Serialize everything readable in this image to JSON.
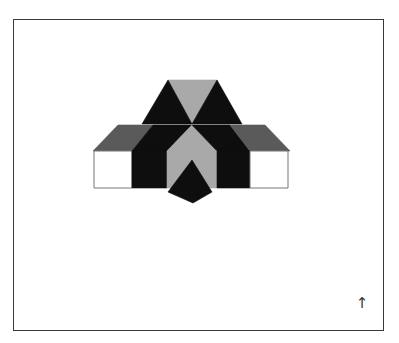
{
  "figure": {
    "frame": {
      "x": 13,
      "y": 19,
      "width": 371,
      "height": 312,
      "stroke": "#3a3a3a"
    },
    "colors": {
      "black": "#0e0e0e",
      "light_gray": "#a9a9a9",
      "mid_gray": "#5a5a5a",
      "white": "#ffffff",
      "outline": "#777777"
    },
    "shapes": [
      {
        "name": "top-gray-triangle",
        "fill": "light_gray",
        "points": "168,80 217,80 192,124"
      },
      {
        "name": "left-black-triangle",
        "fill": "black",
        "points": "168,80 142,124 192,124"
      },
      {
        "name": "right-black-triangle",
        "fill": "black",
        "points": "217,80 192,124 242,124"
      },
      {
        "name": "left-roof",
        "fill": "mid_gray",
        "points": "118,125 153,125 132,151 93,151"
      },
      {
        "name": "left-black-roof",
        "fill": "black",
        "points": "153,125 192,125 167,151 132,151"
      },
      {
        "name": "middle-gray-triangle",
        "fill": "light_gray",
        "points": "192,125 217,151 167,151"
      },
      {
        "name": "right-black-roof",
        "fill": "black",
        "points": "192,125 230,125 250,151 217,151"
      },
      {
        "name": "right-roof",
        "fill": "mid_gray",
        "points": "230,125 265,125 290,151 250,151"
      },
      {
        "name": "left-white-wall",
        "fill": "white",
        "points": "94,151 132,151 132,188 94,188"
      },
      {
        "name": "left-black-wall",
        "fill": "black",
        "points": "132,151 167,151 167,188 132,188"
      },
      {
        "name": "center-gray-wall",
        "fill": "light_gray",
        "points": "167,151 217,151 217,188 167,188"
      },
      {
        "name": "right-black-wall",
        "fill": "black",
        "points": "217,151 250,151 250,188 217,188"
      },
      {
        "name": "right-white-wall",
        "fill": "white",
        "points": "250,151 288,151 288,188 250,188"
      },
      {
        "name": "center-black-pentagon",
        "fill": "black",
        "points": "192,160 212,192 193,203 168,192"
      }
    ],
    "north_arrow": {
      "glyph": "↑",
      "x": 362,
      "y": 303
    }
  }
}
